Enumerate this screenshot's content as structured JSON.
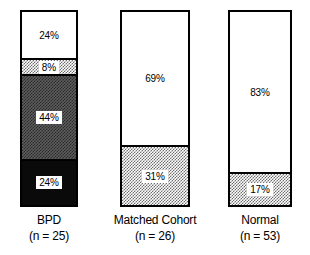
{
  "chart_data": {
    "type": "bar",
    "subtype": "stacked-100-percent",
    "title": "",
    "xlabel": "",
    "ylabel": "",
    "ylim": [
      0,
      100
    ],
    "grid": false,
    "legend": "none",
    "categories": [
      "BPD",
      "Matched Cohort",
      "Normal"
    ],
    "category_counts": [
      "(n = 25)",
      "(n = 26)",
      "(n = 53)"
    ],
    "groups": [
      {
        "name": "BPD",
        "count_label": "(n = 25)",
        "segments": [
          {
            "value": 24,
            "label": "24%",
            "fill": "white",
            "label_plate": false
          },
          {
            "value": 8,
            "label": "8%",
            "fill": "light",
            "label_plate": true
          },
          {
            "value": 44,
            "label": "44%",
            "fill": "mid",
            "label_plate": true
          },
          {
            "value": 24,
            "label": "24%",
            "fill": "black",
            "label_plate": true
          }
        ]
      },
      {
        "name": "Matched Cohort",
        "count_label": "(n = 26)",
        "segments": [
          {
            "value": 69,
            "label": "69%",
            "fill": "white",
            "label_plate": false
          },
          {
            "value": 31,
            "label": "31%",
            "fill": "light",
            "label_plate": true
          }
        ]
      },
      {
        "name": "Normal",
        "count_label": "(n = 53)",
        "segments": [
          {
            "value": 83,
            "label": "83%",
            "fill": "white",
            "label_plate": false
          },
          {
            "value": 17,
            "label": "17%",
            "fill": "light",
            "label_plate": true
          }
        ]
      }
    ],
    "colors": {
      "background": "#ffffff",
      "outline": "#000000",
      "fill_white": "#ffffff",
      "fill_light": "#b4b4b4",
      "fill_mid": "#5e5e5e",
      "fill_black": "#0a0a0a",
      "text": "#000000"
    }
  },
  "layout": {
    "bars": [
      {
        "left": 20,
        "width": 58
      },
      {
        "left": 120,
        "width": 70
      },
      {
        "left": 228,
        "width": 64
      }
    ],
    "bar_top": 10,
    "bar_height": 197
  }
}
